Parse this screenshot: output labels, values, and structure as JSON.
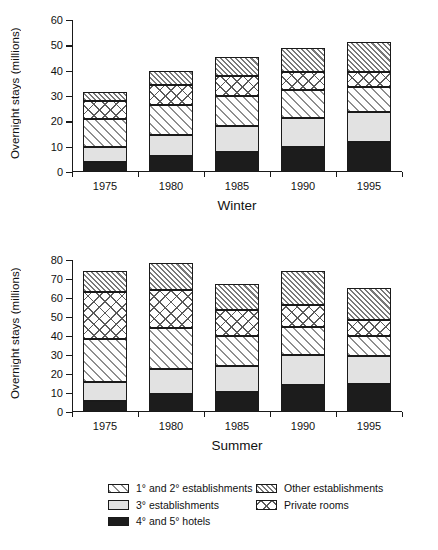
{
  "axis": {
    "ylabel": "Overnight stays (millions)",
    "winter_ticks": [
      "0",
      "10",
      "20",
      "30",
      "40",
      "50",
      "60"
    ],
    "summer_ticks": [
      "0",
      "10",
      "20",
      "30",
      "40",
      "50",
      "60",
      "70",
      "80"
    ],
    "categories": [
      "1975",
      "1980",
      "1985",
      "1990",
      "1995"
    ]
  },
  "panels": {
    "winter": {
      "title": "Winter"
    },
    "summer": {
      "title": "Summer"
    }
  },
  "legend": {
    "left": [
      {
        "label": "1° and 2° establishments",
        "swatch": "diagonal-hatch-wide-swatch"
      },
      {
        "label": "3° establishments",
        "swatch": "light-gray-solid-swatch"
      },
      {
        "label": "4° and 5° hotels",
        "swatch": "black-solid-swatch"
      }
    ],
    "right": [
      {
        "label": "Other establishments",
        "swatch": "diagonal-hatch-dense-swatch"
      },
      {
        "label": "Private rooms",
        "swatch": "crosshatch-swatch"
      }
    ]
  },
  "colors": {
    "axis": "#1a1a1a",
    "hotels": "#1c1c1c",
    "three_star": "#e2e2e2",
    "hatch": "#8e8e8e",
    "background": "#ffffff"
  },
  "chart_data": [
    {
      "type": "bar",
      "subtype": "stacked",
      "title": "Winter",
      "xlabel": "Winter",
      "ylabel": "Overnight stays (millions)",
      "ylim": [
        0,
        60
      ],
      "ytick_step": 10,
      "grid": false,
      "legend_position": "bottom",
      "categories": [
        "1975",
        "1980",
        "1985",
        "1990",
        "1995"
      ],
      "series": [
        {
          "name": "4° and 5° hotels",
          "values": [
            4.0,
            6.5,
            8.0,
            10.0,
            12.0
          ]
        },
        {
          "name": "3° establishments",
          "values": [
            6.0,
            8.0,
            10.0,
            11.5,
            11.5
          ]
        },
        {
          "name": "1° and 2° establishments",
          "values": [
            11.0,
            12.0,
            12.0,
            11.0,
            10.0
          ]
        },
        {
          "name": "Private rooms",
          "values": [
            7.0,
            8.0,
            8.0,
            7.0,
            6.0
          ]
        },
        {
          "name": "Other establishments",
          "values": [
            3.5,
            5.5,
            7.5,
            9.5,
            12.0
          ]
        }
      ],
      "totals": [
        31.5,
        40.0,
        45.5,
        49.0,
        51.5
      ]
    },
    {
      "type": "bar",
      "subtype": "stacked",
      "title": "Summer",
      "xlabel": "Summer",
      "ylabel": "Overnight stays (millions)",
      "ylim": [
        0,
        80
      ],
      "ytick_step": 10,
      "grid": false,
      "legend_position": "bottom",
      "categories": [
        "1975",
        "1980",
        "1985",
        "1990",
        "1995"
      ],
      "series": [
        {
          "name": "4° and 5° hotels",
          "values": [
            6.0,
            9.5,
            10.5,
            14.0,
            14.5
          ]
        },
        {
          "name": "3° establishments",
          "values": [
            10.0,
            13.0,
            13.5,
            16.0,
            15.0
          ]
        },
        {
          "name": "1° and 2° establishments",
          "values": [
            22.5,
            21.5,
            16.0,
            14.5,
            10.5
          ]
        },
        {
          "name": "Private rooms",
          "values": [
            24.5,
            20.0,
            13.5,
            12.0,
            8.5
          ]
        },
        {
          "name": "Other establishments",
          "values": [
            11.0,
            14.5,
            14.0,
            17.5,
            17.0
          ]
        }
      ],
      "totals": [
        74.0,
        78.5,
        67.5,
        74.0,
        65.5
      ]
    }
  ]
}
